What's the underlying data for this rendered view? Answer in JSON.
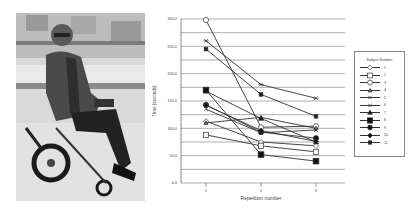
{
  "photo": {
    "description": "Man seated in powered wheelchair in laboratory"
  },
  "chart_data": {
    "type": "line",
    "title": "",
    "xlabel": "Repetition number",
    "ylabel": "Time (seconds)",
    "x": [
      1,
      2,
      3
    ],
    "x_ticks": [
      "1",
      "2",
      "3"
    ],
    "y_ticks": [
      "0.0",
      "50.0",
      "100.0",
      "150.0",
      "200.0",
      "250.0",
      "300.0"
    ],
    "ylim": [
      0,
      300
    ],
    "grid": "horizontal every 25",
    "legend_title": "Subject Number",
    "legend_position": "right",
    "series": [
      {
        "name": "1",
        "marker": "diamond-open",
        "values": [
          113,
          75,
          68
        ]
      },
      {
        "name": "2",
        "marker": "square-open",
        "values": [
          88,
          68,
          57
        ]
      },
      {
        "name": "3",
        "marker": "circle-open",
        "values": [
          298,
          102,
          104
        ]
      },
      {
        "name": "4",
        "marker": "triangle-small",
        "values": [
          110,
          120,
          100
        ]
      },
      {
        "name": "5",
        "marker": "star",
        "values": [
          260,
          180,
          155
        ]
      },
      {
        "name": "6",
        "marker": "x",
        "values": [
          135,
          92,
          97
        ]
      },
      {
        "name": "7",
        "marker": "triangle-filled",
        "values": [
          168,
          118,
          75
        ]
      },
      {
        "name": "8",
        "marker": "square-filled",
        "values": [
          170,
          52,
          40
        ]
      },
      {
        "name": "9",
        "marker": "circle-filled",
        "values": [
          143,
          93,
          82
        ]
      },
      {
        "name": "10",
        "marker": "diamond-filled",
        "values": [
          142,
          96,
          76
        ]
      },
      {
        "name": "11",
        "marker": "small-square-filled",
        "values": [
          245,
          162,
          122
        ]
      }
    ]
  },
  "legend": {
    "title": "Subject Number",
    "items": [
      "1",
      "2",
      "3",
      "4",
      "5",
      "6",
      "7",
      "8",
      "9",
      "10",
      "11"
    ]
  }
}
